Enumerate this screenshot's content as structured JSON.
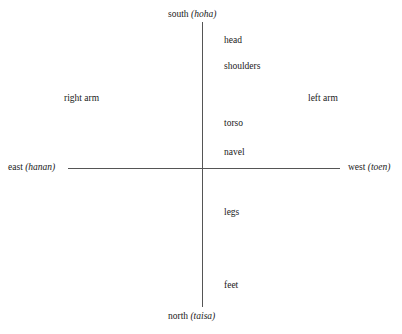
{
  "figure": {
    "title": "",
    "axis_color": "#555555",
    "text_color": "#1a1a1a",
    "background": "#ffffff"
  },
  "directions": {
    "south": {
      "english": "south ",
      "native": "(hoha)"
    },
    "north": {
      "english": "north ",
      "native": "(taisa)"
    },
    "east": {
      "english": "east ",
      "native": "(hanan)"
    },
    "west": {
      "english": "west ",
      "native": "(toen)"
    }
  },
  "body_parts": {
    "head": "head",
    "shoulders": "shoulders",
    "right_arm": "right arm",
    "left_arm": "left arm",
    "torso": "torso",
    "navel": "navel",
    "legs": "legs",
    "feet": "feet"
  }
}
